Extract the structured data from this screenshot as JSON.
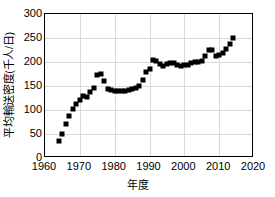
{
  "chart_data": {
    "type": "scatter",
    "title": "",
    "xlabel": "年度",
    "ylabel": "平均輸送密度(千人/日)",
    "xlim": [
      1960,
      2020
    ],
    "ylim": [
      0,
      300
    ],
    "xticks": [
      1960,
      1970,
      1980,
      1990,
      2000,
      2010,
      2020
    ],
    "yticks": [
      0,
      50,
      100,
      150,
      200,
      250,
      300
    ],
    "grid": true,
    "legend": "none",
    "marker": "square",
    "marker_color": "#000000",
    "x": [
      1964,
      1965,
      1966,
      1967,
      1968,
      1969,
      1970,
      1971,
      1972,
      1973,
      1974,
      1975,
      1976,
      1977,
      1978,
      1979,
      1980,
      1981,
      1982,
      1983,
      1984,
      1985,
      1986,
      1987,
      1988,
      1989,
      1990,
      1991,
      1992,
      1993,
      1994,
      1995,
      1996,
      1997,
      1998,
      1999,
      2000,
      2001,
      2002,
      2003,
      2004,
      2005,
      2006,
      2007,
      2008,
      2009,
      2010,
      2011,
      2012,
      2013,
      2014
    ],
    "values": [
      35,
      51,
      70,
      88,
      103,
      113,
      121,
      130,
      128,
      137,
      145,
      172,
      174,
      160,
      144,
      141,
      140,
      139,
      139,
      140,
      141,
      143,
      146,
      151,
      162,
      180,
      185,
      204,
      203,
      196,
      192,
      196,
      197,
      198,
      193,
      191,
      194,
      193,
      197,
      199,
      200,
      203,
      212,
      226,
      226,
      212,
      215,
      219,
      228,
      238,
      249
    ]
  },
  "axes": {
    "y_tick_labels": [
      "300",
      "250",
      "200",
      "150",
      "100",
      "50",
      "0"
    ],
    "x_tick_labels": [
      "1960",
      "1970",
      "1980",
      "1990",
      "2000",
      "2010",
      "2020"
    ]
  }
}
